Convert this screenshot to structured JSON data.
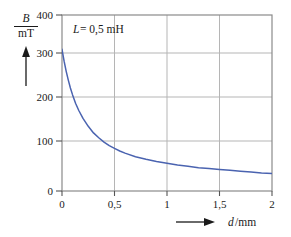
{
  "figure": {
    "background": "#ffffff",
    "frame_color": "#8a8a8a",
    "grid_color": "#b5b5b5",
    "curve_color": "#4a63b0",
    "text_color": "#1a1a1a"
  },
  "labels": {
    "y_axis_numerator": "B",
    "y_axis_denominator": "mT",
    "x_axis_symbol": "d",
    "x_axis_unit": "mm",
    "x_axis_separator": "/",
    "x_axis_full": "d /mm",
    "annotation": "L = 0,5 mH",
    "annotation_symbol": "L",
    "annotation_value": "= 0,5 mH",
    "y_arrow_icon": "arrow-up",
    "x_arrow_icon": "arrow-right"
  },
  "chart_data": {
    "type": "line",
    "title": "",
    "subtitle": "",
    "xlabel": "d /mm",
    "ylabel": "B / mT",
    "xlim": [
      0,
      2
    ],
    "ylim": [
      0,
      400
    ],
    "xticks": [
      0,
      0.5,
      1,
      1.5,
      2
    ],
    "xtick_labels": [
      "0",
      "0,5",
      "1",
      "1,5",
      "2"
    ],
    "yticks": [
      0,
      100,
      200,
      300,
      400
    ],
    "ytick_labels": [
      "0",
      "100",
      "200",
      "300",
      "400"
    ],
    "grid": true,
    "legend": false,
    "annotations": [
      {
        "text": "L = 0,5 mH",
        "x": 0.12,
        "y": 365
      }
    ],
    "series": [
      {
        "name": "B(d)",
        "color": "#4a63b0",
        "x": [
          0.0,
          0.02,
          0.04,
          0.06,
          0.08,
          0.1,
          0.13,
          0.16,
          0.2,
          0.25,
          0.3,
          0.35,
          0.4,
          0.45,
          0.5,
          0.55,
          0.6,
          0.7,
          0.8,
          0.9,
          1.0,
          1.1,
          1.2,
          1.3,
          1.4,
          1.5,
          1.6,
          1.7,
          1.8,
          1.9,
          2.0
        ],
        "y": [
          322,
          295,
          272,
          252,
          234,
          219,
          199,
          183,
          165,
          147,
          132,
          121,
          111,
          103,
          97,
          91,
          86,
          78,
          72,
          67,
          63,
          59,
          56,
          53,
          51,
          49,
          47,
          45,
          43,
          41,
          40
        ]
      }
    ]
  }
}
